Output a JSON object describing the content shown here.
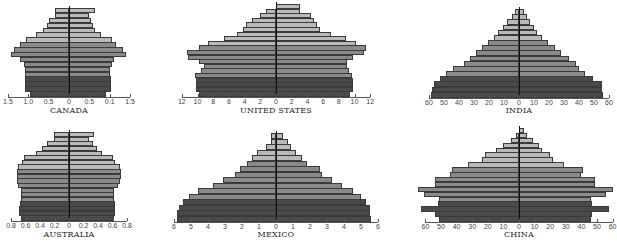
{
  "colors": {
    "light": "#b9b9b9",
    "mid": "#8a8a8a",
    "dark": "#4a4a4a",
    "border": "#3a3a3a",
    "axis": "#555555"
  },
  "chart_data": [
    {
      "type": "bar",
      "subtype": "population-pyramid",
      "title": "CANADA",
      "x_ticks": [
        "1.5",
        "1.0",
        "0.5",
        "0",
        "0.5",
        "0.1",
        "1.5"
      ],
      "tick_values": [
        -1.5,
        -1.0,
        -0.5,
        0,
        0.5,
        1.0,
        1.5
      ],
      "xlim": [
        -1.5,
        1.5
      ],
      "layout": {
        "cx": 69,
        "scale": 40.7,
        "top": 8,
        "bottom": 96,
        "title_y": 106
      },
      "bands": {
        "dark": 4,
        "mid": 7
      },
      "series": [
        {
          "name": "left",
          "values": [
            0.95,
            1.07,
            1.07,
            1.07,
            1.07,
            1.07,
            1.1,
            1.2,
            1.42,
            1.35,
            1.2,
            1.05,
            0.8,
            0.63,
            0.55,
            0.48,
            0.35,
            0.35
          ]
        },
        {
          "name": "right",
          "values": [
            0.92,
            1.03,
            1.03,
            1.03,
            1.01,
            1.01,
            1.05,
            1.1,
            1.39,
            1.32,
            1.15,
            1.05,
            0.78,
            0.65,
            0.6,
            0.55,
            0.5,
            0.65
          ]
        }
      ]
    },
    {
      "type": "bar",
      "subtype": "population-pyramid",
      "title": "UNITED STATES",
      "x_ticks": [
        "12",
        "10",
        "8",
        "6",
        "4",
        "2",
        "0",
        "2",
        "4",
        "6",
        "8",
        "10",
        "12"
      ],
      "tick_values": [
        -12,
        -10,
        -8,
        -6,
        -4,
        -2,
        0,
        2,
        4,
        6,
        8,
        10,
        12
      ],
      "xlim": [
        -12,
        12
      ],
      "layout": {
        "cx": 276,
        "scale": 7.85,
        "top": 4,
        "bottom": 96,
        "title_y": 106
      },
      "bands": {
        "dark": 4,
        "mid": 7
      },
      "series": [
        {
          "name": "left",
          "values": [
            9.8,
            10.2,
            10.2,
            10.2,
            10.3,
            9.6,
            9.2,
            9.8,
            11.2,
            11.3,
            9.8,
            8.6,
            6.6,
            5.0,
            4.2,
            3.8,
            3.1,
            2.0,
            1.3
          ]
        },
        {
          "name": "right",
          "values": [
            9.4,
            9.8,
            9.8,
            9.8,
            9.7,
            9.3,
            9.1,
            9.0,
            9.8,
            11.2,
            11.5,
            10.2,
            8.9,
            7.0,
            5.6,
            5.2,
            4.8,
            4.4,
            3.0,
            3.0
          ]
        }
      ]
    },
    {
      "type": "bar",
      "subtype": "population-pyramid",
      "title": "INDIA",
      "x_ticks": [
        "60",
        "50",
        "40",
        "30",
        "20",
        "10",
        "0",
        "10",
        "20",
        "30",
        "40",
        "50",
        "60"
      ],
      "tick_values": [
        -60,
        -50,
        -40,
        -30,
        -20,
        -10,
        0,
        10,
        20,
        30,
        40,
        50,
        60
      ],
      "xlim": [
        -60,
        60
      ],
      "layout": {
        "cx": 519,
        "scale": 1.5,
        "top": 9,
        "bottom": 97,
        "title_y": 106
      },
      "bands": {
        "dark": 4,
        "mid": 7
      },
      "series": [
        {
          "name": "left",
          "values": [
            59,
            58,
            57,
            53,
            49,
            44,
            37,
            33,
            29,
            25,
            21,
            17,
            14,
            11,
            8,
            5,
            3
          ]
        },
        {
          "name": "right",
          "values": [
            56,
            55,
            55,
            49,
            44,
            40,
            38,
            33,
            28,
            24,
            19,
            15,
            12,
            10,
            7,
            5,
            3
          ]
        }
      ]
    },
    {
      "type": "bar",
      "subtype": "population-pyramid",
      "title": "AUSTRALIA",
      "x_ticks": [
        "0.8",
        "0.6",
        "0.4",
        "0.2",
        "0",
        "0.2",
        "0.4",
        "0.6",
        "0.8"
      ],
      "tick_values": [
        -0.8,
        -0.6,
        -0.4,
        -0.2,
        0,
        0.2,
        0.4,
        0.6,
        0.8
      ],
      "xlim": [
        -0.8,
        0.8
      ],
      "layout": {
        "cx": 69,
        "scale": 72.5,
        "top": 132,
        "bottom": 220,
        "title_y": 230
      },
      "bands": {
        "dark": 4,
        "mid": 7
      },
      "series": [
        {
          "name": "left",
          "values": [
            0.66,
            0.69,
            0.69,
            0.68,
            0.66,
            0.66,
            0.66,
            0.71,
            0.72,
            0.72,
            0.72,
            0.71,
            0.65,
            0.62,
            0.46,
            0.37,
            0.31,
            0.21,
            0.21
          ]
        },
        {
          "name": "right",
          "values": [
            0.62,
            0.64,
            0.64,
            0.64,
            0.62,
            0.62,
            0.62,
            0.67,
            0.7,
            0.72,
            0.72,
            0.7,
            0.63,
            0.6,
            0.45,
            0.38,
            0.33,
            0.28,
            0.35
          ]
        }
      ]
    },
    {
      "type": "bar",
      "subtype": "population-pyramid",
      "title": "MEXICO",
      "x_ticks": [
        "6",
        "5",
        "4",
        "3",
        "2",
        "1",
        "0",
        "1",
        "2",
        "3",
        "4",
        "5",
        "6"
      ],
      "tick_values": [
        -6,
        -5,
        -4,
        -3,
        -2,
        -1,
        0,
        1,
        2,
        3,
        4,
        5,
        6
      ],
      "xlim": [
        -6,
        6
      ],
      "layout": {
        "cx": 276,
        "scale": 17.0,
        "top": 133,
        "bottom": 221,
        "title_y": 230
      },
      "bands": {
        "dark": 4,
        "mid": 7
      },
      "series": [
        {
          "name": "left",
          "values": [
            5.8,
            5.8,
            5.7,
            5.5,
            5.1,
            4.6,
            3.7,
            3.1,
            2.4,
            2.1,
            1.7,
            1.4,
            1.1,
            0.6,
            0.3,
            0.3
          ]
        },
        {
          "name": "right",
          "values": [
            5.6,
            5.5,
            5.5,
            5.3,
            5.0,
            4.5,
            3.9,
            3.3,
            2.7,
            2.6,
            1.8,
            1.5,
            1.2,
            0.9,
            0.7,
            0.4
          ]
        }
      ]
    },
    {
      "type": "bar",
      "subtype": "population-pyramid",
      "title": "CHINA",
      "x_ticks": [
        "60",
        "50",
        "40",
        "30",
        "20",
        "10",
        "0",
        "10",
        "20",
        "30",
        "40",
        "50",
        "60"
      ],
      "tick_values": [
        -60,
        -50,
        -40,
        -30,
        -20,
        -10,
        0,
        10,
        20,
        30,
        40,
        50,
        60
      ],
      "xlim": [
        -60,
        60
      ],
      "layout": {
        "cx": 519,
        "scale": 1.56,
        "top": 128,
        "bottom": 221,
        "title_y": 230
      },
      "bands": {
        "dark": 4,
        "mid": 7
      },
      "series": [
        {
          "name": "left",
          "values": [
            51,
            54,
            63,
            52,
            51,
            61,
            65,
            54,
            54,
            44,
            43,
            33,
            24,
            22,
            15,
            10,
            5,
            2
          ]
        },
        {
          "name": "right",
          "values": [
            46,
            47,
            58,
            47,
            46,
            56,
            60,
            49,
            49,
            40,
            41,
            29,
            22,
            20,
            15,
            13,
            9,
            5,
            3
          ]
        }
      ]
    }
  ]
}
